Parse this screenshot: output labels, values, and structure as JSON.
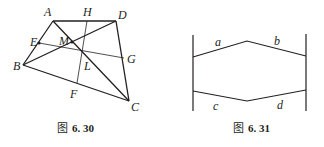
{
  "figures": [
    {
      "caption_prefix": "图",
      "caption_number": "6. 30",
      "points": {
        "A": "A",
        "H": "H",
        "D": "D",
        "E": "E",
        "M": "M",
        "G": "G",
        "B": "B",
        "L": "L",
        "F": "F",
        "C": "C"
      }
    },
    {
      "caption_prefix": "图",
      "caption_number": "6. 31",
      "segments": {
        "a": "a",
        "b": "b",
        "c": "c",
        "d": "d"
      }
    }
  ],
  "colors": {
    "line": "#231f20",
    "background": "#ffffff"
  }
}
